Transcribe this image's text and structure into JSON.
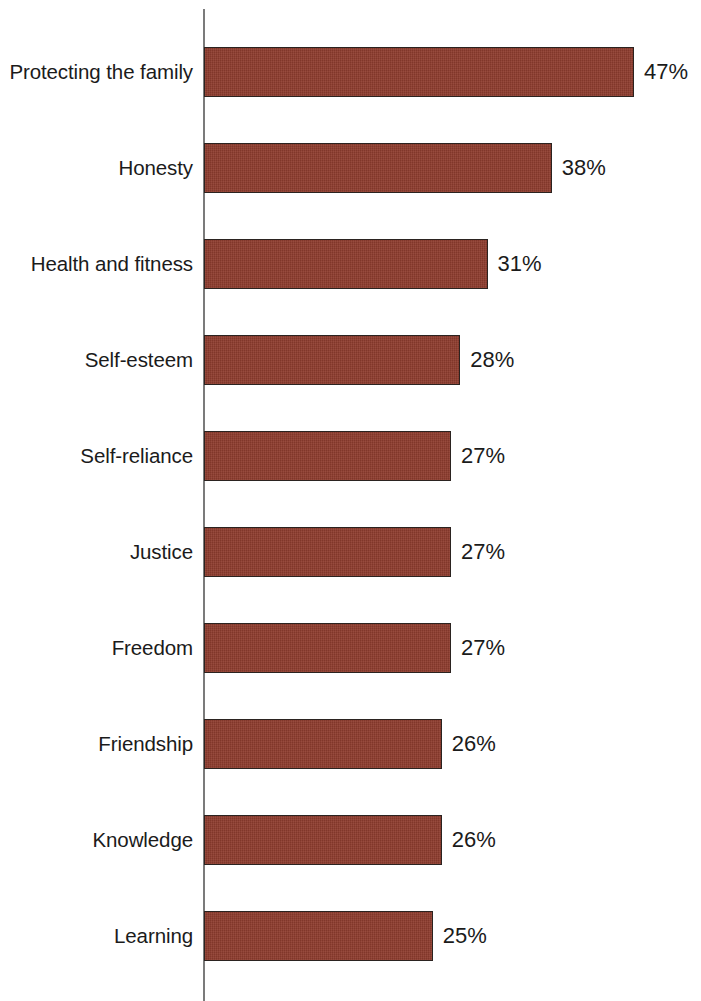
{
  "chart_data": {
    "type": "bar",
    "orientation": "horizontal",
    "title": "",
    "subtitle": "",
    "xlabel": "",
    "ylabel": "",
    "xlim": [
      0,
      47
    ],
    "grid": false,
    "legend": null,
    "value_suffix": "%",
    "categories": [
      "Protecting the family",
      "Honesty",
      "Health and fitness",
      "Self-esteem",
      "Self-reliance",
      "Justice",
      "Freedom",
      "Friendship",
      "Knowledge",
      "Learning"
    ],
    "values": [
      47,
      38,
      31,
      28,
      27,
      27,
      27,
      26,
      26,
      25
    ],
    "value_labels": [
      "47%",
      "38%",
      "31%",
      "28%",
      "27%",
      "27%",
      "27%",
      "26%",
      "26%",
      "25%"
    ],
    "bars": [
      {
        "category": "Protecting the family",
        "value": 47,
        "label": "47%"
      },
      {
        "category": "Honesty",
        "value": 38,
        "label": "38%"
      },
      {
        "category": "Health and fitness",
        "value": 31,
        "label": "31%"
      },
      {
        "category": "Self-esteem",
        "value": 28,
        "label": "28%"
      },
      {
        "category": "Self-reliance",
        "value": 27,
        "label": "27%"
      },
      {
        "category": "Justice",
        "value": 27,
        "label": "27%"
      },
      {
        "category": "Freedom",
        "value": 27,
        "label": "27%"
      },
      {
        "category": "Friendship",
        "value": 26,
        "label": "26%"
      },
      {
        "category": "Knowledge",
        "value": 26,
        "label": "26%"
      },
      {
        "category": "Learning",
        "value": 25,
        "label": "25%"
      }
    ],
    "colors": {
      "bar_fill": "#8e3c2e",
      "bar_border": "#2b2320",
      "axis_line": "#7b7b7b",
      "text": "#1b1b1b",
      "background": "#ffffff"
    }
  }
}
